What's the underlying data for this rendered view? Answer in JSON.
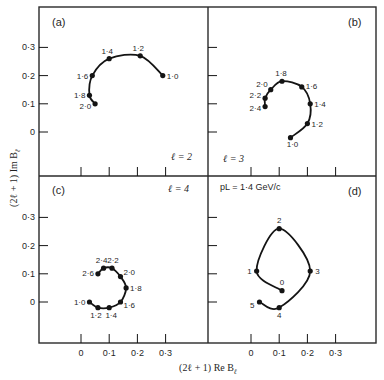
{
  "figure": {
    "ylabel": "(2ℓ + 1)  Im B",
    "ylabel_sub": "ℓ",
    "xlabel": "(2ℓ + 1)   Re B",
    "xlabel_sub": "ℓ",
    "x_ticks": [
      "0",
      "0·1",
      "0·2",
      "0·3"
    ],
    "y_ticks": [
      "0",
      "0·1",
      "0·2",
      "0·3"
    ]
  },
  "chart_data": [
    {
      "type": "line",
      "panel": "(a)",
      "annotation": "ℓ = 2",
      "xlabel": "(2ℓ + 1) Re Bℓ",
      "ylabel": "(2ℓ + 1) Im Bℓ",
      "xlim": [
        -0.1,
        0.43
      ],
      "ylim": [
        -0.15,
        0.44
      ],
      "x_ticks": [
        0,
        0.1,
        0.2,
        0.3
      ],
      "y_ticks": [
        0,
        0.1,
        0.2,
        0.3
      ],
      "point_label_meaning": "momentum (GeV/c)",
      "points": [
        {
          "label": "1·0",
          "re": 0.29,
          "im": 0.2
        },
        {
          "label": "1·2",
          "re": 0.21,
          "im": 0.27
        },
        {
          "label": "1·4",
          "re": 0.1,
          "im": 0.26
        },
        {
          "label": "1·6",
          "re": 0.04,
          "im": 0.2
        },
        {
          "label": "1·8",
          "re": 0.03,
          "im": 0.13
        },
        {
          "label": "2·0",
          "re": 0.05,
          "im": 0.1
        }
      ]
    },
    {
      "type": "line",
      "panel": "(b)",
      "annotation": "ℓ = 3",
      "xlim": [
        -0.1,
        0.43
      ],
      "ylim": [
        -0.15,
        0.44
      ],
      "points": [
        {
          "label": "1·0",
          "re": 0.14,
          "im": -0.02
        },
        {
          "label": "1·2",
          "re": 0.2,
          "im": 0.03
        },
        {
          "label": "1·4",
          "re": 0.21,
          "im": 0.1
        },
        {
          "label": "1·6",
          "re": 0.18,
          "im": 0.16
        },
        {
          "label": "1·8",
          "re": 0.11,
          "im": 0.18
        },
        {
          "label": "2·0",
          "re": 0.07,
          "im": 0.15
        },
        {
          "label": "2·2",
          "re": 0.05,
          "im": 0.12
        },
        {
          "label": "2·4",
          "re": 0.05,
          "im": 0.09
        }
      ]
    },
    {
      "type": "line",
      "panel": "(c)",
      "annotation": "ℓ = 4",
      "xlim": [
        -0.1,
        0.43
      ],
      "ylim": [
        -0.15,
        0.44
      ],
      "points": [
        {
          "label": "1·0",
          "re": 0.03,
          "im": 0.0
        },
        {
          "label": "1·2",
          "re": 0.06,
          "im": -0.02
        },
        {
          "label": "1·4",
          "re": 0.1,
          "im": -0.02
        },
        {
          "label": "1·6",
          "re": 0.14,
          "im": 0.0
        },
        {
          "label": "1·8",
          "re": 0.16,
          "im": 0.05
        },
        {
          "label": "2·0",
          "re": 0.14,
          "im": 0.09
        },
        {
          "label": "2·2",
          "re": 0.11,
          "im": 0.12
        },
        {
          "label": "2·4",
          "re": 0.08,
          "im": 0.12
        },
        {
          "label": "2·6",
          "re": 0.06,
          "im": 0.1
        }
      ]
    },
    {
      "type": "line",
      "panel": "(d)",
      "annotation": "pL = 1·4 GeV/c",
      "point_label_meaning": "partial wave ℓ",
      "xlim": [
        -0.1,
        0.43
      ],
      "ylim": [
        -0.15,
        0.44
      ],
      "points": [
        {
          "label": "0",
          "re": 0.11,
          "im": 0.04
        },
        {
          "label": "1",
          "re": 0.02,
          "im": 0.11
        },
        {
          "label": "2",
          "re": 0.1,
          "im": 0.26
        },
        {
          "label": "3",
          "re": 0.21,
          "im": 0.11
        },
        {
          "label": "4",
          "re": 0.1,
          "im": -0.02
        },
        {
          "label": "5",
          "re": 0.03,
          "im": 0.0
        }
      ]
    }
  ],
  "panels_layout": [
    {
      "name": "panel-a",
      "x0": 81,
      "y0": 132,
      "frame": [
        39,
        7,
        208,
        176
      ],
      "label_pos": [
        52,
        26
      ],
      "ann_pos": [
        171,
        160
      ],
      "label_offsets": [
        [
          4,
          3,
          "start"
        ],
        [
          -2,
          -5,
          "middle"
        ],
        [
          -2,
          -5,
          "middle"
        ],
        [
          -4,
          3,
          "end"
        ],
        [
          -4,
          3,
          "end"
        ],
        [
          -4,
          5,
          "end"
        ]
      ]
    },
    {
      "name": "panel-b",
      "x0": 251,
      "y0": 132,
      "frame": [
        208,
        7,
        376,
        176
      ],
      "label_pos": [
        348,
        26
      ],
      "ann_pos": [
        223,
        162
      ],
      "label_offsets": [
        [
          2,
          9,
          "middle"
        ],
        [
          4,
          3,
          "start"
        ],
        [
          4,
          3,
          "start"
        ],
        [
          4,
          2,
          "start"
        ],
        [
          -1,
          -5,
          "middle"
        ],
        [
          -3,
          -3,
          "end"
        ],
        [
          -4,
          0,
          "end"
        ],
        [
          -4,
          4,
          "end"
        ]
      ]
    },
    {
      "name": "panel-c",
      "x0": 81,
      "y0": 302,
      "frame": [
        39,
        176,
        208,
        343
      ],
      "label_pos": [
        52,
        194
      ],
      "ann_pos": [
        168,
        192
      ],
      "label_offsets": [
        [
          -4,
          3,
          "end"
        ],
        [
          -2,
          10,
          "middle"
        ],
        [
          2,
          10,
          "middle"
        ],
        [
          3,
          6,
          "start"
        ],
        [
          4,
          3,
          "start"
        ],
        [
          3,
          -2,
          "start"
        ],
        [
          1,
          -5,
          "middle"
        ],
        [
          -2,
          -5,
          "middle"
        ],
        [
          -4,
          2,
          "end"
        ]
      ]
    },
    {
      "name": "panel-d",
      "x0": 251,
      "y0": 302,
      "frame": [
        208,
        176,
        376,
        343
      ],
      "label_pos": [
        348,
        195
      ],
      "ann_pos": [
        220,
        190
      ],
      "label_offsets": [
        [
          0,
          -6,
          "middle"
        ],
        [
          -5,
          3,
          "end"
        ],
        [
          0,
          -6,
          "middle"
        ],
        [
          5,
          3,
          "start"
        ],
        [
          0,
          10,
          "middle"
        ],
        [
          -5,
          6,
          "end"
        ]
      ]
    }
  ],
  "colors": {
    "ink": "#141414",
    "frame": "#2a2a2a",
    "paper": "#ffffff"
  }
}
